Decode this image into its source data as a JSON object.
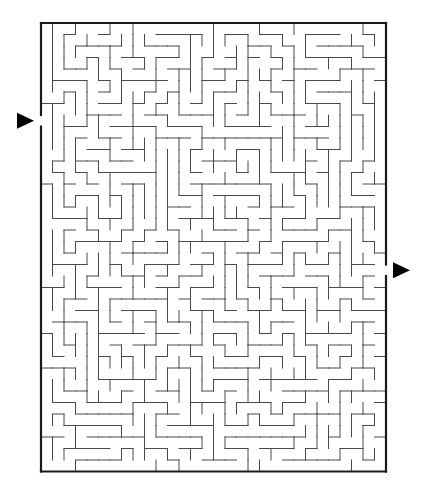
{
  "maze": {
    "cols": 30,
    "rows": 39,
    "origin": {
      "x": 41,
      "y": 23
    },
    "cell_size": 11.5,
    "wall_color": "#4a4a4a",
    "border_color": "#1a1a1a",
    "arrow_color": "#000000",
    "entrance": {
      "side": "left",
      "row": 8,
      "arrow_icon": "right-pointing-triangle"
    },
    "exit": {
      "side": "right",
      "row": 21,
      "arrow_icon": "right-pointing-triangle"
    },
    "seed": 20240517
  }
}
